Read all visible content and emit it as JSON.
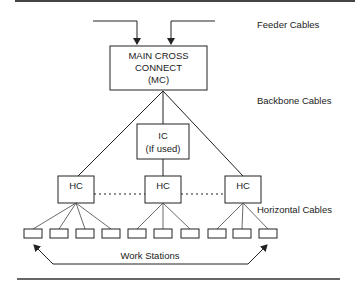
{
  "diagram": {
    "labels": {
      "feeder": "Feeder Cables",
      "backbone": "Backbone Cables",
      "horizontal": "Horizontal Cables",
      "workstations": "Work Stations"
    },
    "mc": {
      "line1": "MAIN CROSS",
      "line2": "CONNECT",
      "line3": "(MC)"
    },
    "ic": {
      "line1": "IC",
      "line2": "(If used)"
    },
    "hc": [
      {
        "label": "HC"
      },
      {
        "label": "HC"
      },
      {
        "label": "HC"
      }
    ],
    "workstation_count": 10,
    "colors": {
      "line": "#222222",
      "rule": "#333333",
      "background": "#ffffff"
    }
  }
}
